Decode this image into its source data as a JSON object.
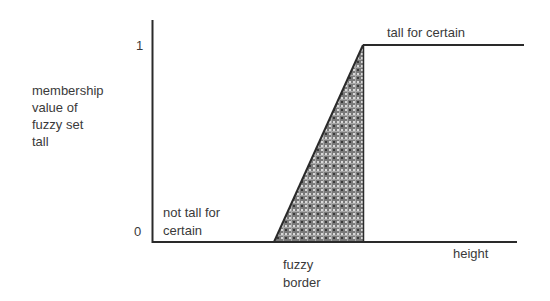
{
  "diagram": {
    "type": "fuzzy-membership-function",
    "y_axis": {
      "label_lines": [
        "membership",
        "value of",
        "fuzzy set",
        "tall"
      ],
      "ticks": [
        "1",
        "0"
      ]
    },
    "x_axis": {
      "label": "height"
    },
    "regions": {
      "low": {
        "label_lines": [
          "not tall for",
          "certain"
        ]
      },
      "high": {
        "label": "tall for certain"
      },
      "transition": {
        "label_lines": [
          "fuzzy",
          "border"
        ]
      }
    },
    "colors": {
      "line": "#2a2a2a",
      "fill": "#6e6e6e",
      "pattern_light": "#d8d8d8"
    }
  }
}
